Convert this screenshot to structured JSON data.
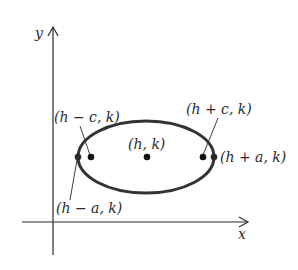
{
  "diagram": {
    "type": "ellipse-with-horizontal-major-axis",
    "colors": {
      "ink": "#2a2a2a",
      "ellipse": "#333333",
      "background": "#ffffff"
    },
    "axes": {
      "x_label": "x",
      "y_label": "y"
    },
    "points": {
      "center": {
        "label": "(h, k)"
      },
      "left_focus": {
        "label": "(h − c, k)"
      },
      "right_focus": {
        "label": "(h + c, k)"
      },
      "left_vertex": {
        "label": "(h − a, k)"
      },
      "right_vertex": {
        "label": "(h + a, k)"
      }
    }
  }
}
